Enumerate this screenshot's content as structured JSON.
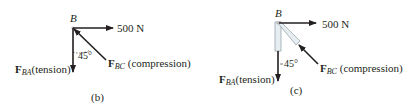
{
  "diagram": {
    "panels": [
      {
        "id": "b",
        "caption": "(b)",
        "point_label": "B",
        "applied_force": "500 N",
        "angle": "45°",
        "force_ba": {
          "symbol": "F",
          "subscript": "BA",
          "note": "(tension)"
        },
        "force_bc": {
          "symbol": "F",
          "subscript": "BC",
          "note": " (compression)"
        }
      },
      {
        "id": "c",
        "caption": "(c)",
        "point_label": "B",
        "applied_force": "500 N",
        "angle": "45°",
        "force_ba": {
          "symbol": "F",
          "subscript": "BA",
          "note": "(tension)"
        },
        "force_bc": {
          "symbol": "F",
          "subscript": "BC",
          "note": " (compression)"
        }
      }
    ],
    "colors": {
      "line": "#231f20",
      "member_fill": "#e6eef2",
      "member_stroke": "#9aa5ab"
    }
  }
}
